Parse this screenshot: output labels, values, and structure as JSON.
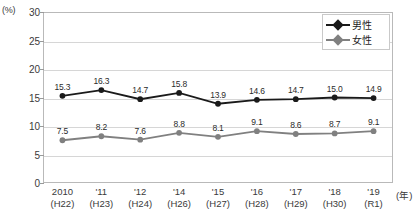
{
  "chart_data": {
    "type": "line",
    "title": "",
    "xlabel": "(年)",
    "ylabel": "(%)",
    "ylim": [
      0,
      30
    ],
    "yticks": [
      0,
      5,
      10,
      15,
      20,
      25,
      30
    ],
    "ytick_labels": [
      "0",
      "5",
      "10",
      "15",
      "20",
      "25",
      "30"
    ],
    "grid": true,
    "legend_position": "top-right",
    "categories": [
      "2010",
      "'11",
      "'12",
      "'14",
      "'15",
      "'16",
      "'17",
      "'18",
      "'19"
    ],
    "category_sub": [
      "(H22)",
      "(H23)",
      "(H24)",
      "(H26)",
      "(H27)",
      "(H28)",
      "(H29)",
      "(H30)",
      "(R1)"
    ],
    "series": [
      {
        "name": "男性",
        "color": "#1a1a1a",
        "values": [
          15.3,
          16.3,
          14.7,
          15.8,
          13.9,
          14.6,
          14.7,
          15.0,
          14.9
        ],
        "labels": [
          "15.3",
          "16.3",
          "14.7",
          "15.8",
          "13.9",
          "14.6",
          "14.7",
          "15.0",
          "14.9"
        ]
      },
      {
        "name": "女性",
        "color": "#808080",
        "values": [
          7.5,
          8.2,
          7.6,
          8.8,
          8.1,
          9.1,
          8.6,
          8.7,
          9.1
        ],
        "labels": [
          "7.5",
          "8.2",
          "7.6",
          "8.8",
          "8.1",
          "9.1",
          "8.6",
          "8.7",
          "9.1"
        ]
      }
    ]
  },
  "legend": {
    "items": [
      {
        "label": "男性",
        "color": "#1a1a1a"
      },
      {
        "label": "女性",
        "color": "#808080"
      }
    ]
  }
}
